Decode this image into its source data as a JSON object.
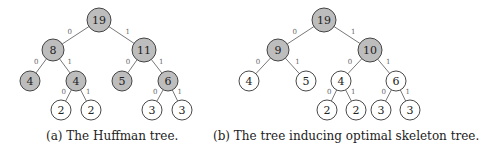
{
  "figures": [
    {
      "id": "a",
      "caption": "(a) The Huffman tree.",
      "caption_x": 46,
      "nodes": [
        {
          "id": "r",
          "label": "19",
          "x": 99,
          "y": 20,
          "r": 12,
          "fill": "gray"
        },
        {
          "id": "n8",
          "label": "8",
          "x": 53,
          "y": 50,
          "r": 11,
          "fill": "gray"
        },
        {
          "id": "n11",
          "label": "11",
          "x": 144,
          "y": 50,
          "r": 12,
          "fill": "gray"
        },
        {
          "id": "n4a",
          "label": "4",
          "x": 30,
          "y": 81,
          "r": 10,
          "fill": "gray"
        },
        {
          "id": "n4b",
          "label": "4",
          "x": 76,
          "y": 81,
          "r": 10,
          "fill": "gray"
        },
        {
          "id": "n5",
          "label": "5",
          "x": 122,
          "y": 81,
          "r": 10,
          "fill": "gray"
        },
        {
          "id": "n6",
          "label": "6",
          "x": 168,
          "y": 81,
          "r": 10,
          "fill": "gray"
        },
        {
          "id": "n2a",
          "label": "2",
          "x": 61,
          "y": 110,
          "r": 10,
          "fill": "white"
        },
        {
          "id": "n2b",
          "label": "2",
          "x": 91,
          "y": 110,
          "r": 10,
          "fill": "white"
        },
        {
          "id": "n3a",
          "label": "3",
          "x": 152,
          "y": 110,
          "r": 10,
          "fill": "white"
        },
        {
          "id": "n3b",
          "label": "3",
          "x": 182,
          "y": 110,
          "r": 10,
          "fill": "white"
        }
      ],
      "edges": [
        {
          "from": "r",
          "to": "n8",
          "label": "0"
        },
        {
          "from": "r",
          "to": "n11",
          "label": "1"
        },
        {
          "from": "n8",
          "to": "n4a",
          "label": "0"
        },
        {
          "from": "n8",
          "to": "n4b",
          "label": "1"
        },
        {
          "from": "n11",
          "to": "n5",
          "label": "0"
        },
        {
          "from": "n11",
          "to": "n6",
          "label": "1"
        },
        {
          "from": "n4b",
          "to": "n2a",
          "label": "0"
        },
        {
          "from": "n4b",
          "to": "n2b",
          "label": "1"
        },
        {
          "from": "n6",
          "to": "n3a",
          "label": "0"
        },
        {
          "from": "n6",
          "to": "n3b",
          "label": "1"
        }
      ]
    },
    {
      "id": "b",
      "caption": "(b) The tree inducing optimal skeleton tree.",
      "caption_x": 213,
      "nodes": [
        {
          "id": "r",
          "label": "19",
          "x": 324,
          "y": 20,
          "r": 12,
          "fill": "gray"
        },
        {
          "id": "n9",
          "label": "9",
          "x": 278,
          "y": 50,
          "r": 11,
          "fill": "gray"
        },
        {
          "id": "n10",
          "label": "10",
          "x": 370,
          "y": 50,
          "r": 12,
          "fill": "gray"
        },
        {
          "id": "n4a",
          "label": "4",
          "x": 249,
          "y": 81,
          "r": 10,
          "fill": "white"
        },
        {
          "id": "n5",
          "label": "5",
          "x": 306,
          "y": 81,
          "r": 10,
          "fill": "white"
        },
        {
          "id": "n4b",
          "label": "4",
          "x": 341,
          "y": 81,
          "r": 10,
          "fill": "white"
        },
        {
          "id": "n6",
          "label": "6",
          "x": 396,
          "y": 81,
          "r": 10,
          "fill": "white"
        },
        {
          "id": "n2a",
          "label": "2",
          "x": 327,
          "y": 110,
          "r": 10,
          "fill": "white"
        },
        {
          "id": "n2b",
          "label": "2",
          "x": 356,
          "y": 110,
          "r": 10,
          "fill": "white"
        },
        {
          "id": "n3a",
          "label": "3",
          "x": 381,
          "y": 110,
          "r": 10,
          "fill": "white"
        },
        {
          "id": "n3b",
          "label": "3",
          "x": 410,
          "y": 110,
          "r": 10,
          "fill": "white"
        }
      ],
      "edges": [
        {
          "from": "r",
          "to": "n9",
          "label": "0"
        },
        {
          "from": "r",
          "to": "n10",
          "label": "1"
        },
        {
          "from": "n9",
          "to": "n4a",
          "label": "0"
        },
        {
          "from": "n9",
          "to": "n5",
          "label": "1"
        },
        {
          "from": "n10",
          "to": "n4b",
          "label": "0"
        },
        {
          "from": "n10",
          "to": "n6",
          "label": "1"
        },
        {
          "from": "n4b",
          "to": "n2a",
          "label": "0"
        },
        {
          "from": "n4b",
          "to": "n2b",
          "label": "1"
        },
        {
          "from": "n6",
          "to": "n3a",
          "label": "0"
        },
        {
          "from": "n6",
          "to": "n3b",
          "label": "1"
        }
      ]
    }
  ],
  "colors": {
    "gray_fill": "#bdbdbd",
    "white_fill": "#ffffff",
    "stroke": "#333333",
    "edge_label": "#666666"
  }
}
